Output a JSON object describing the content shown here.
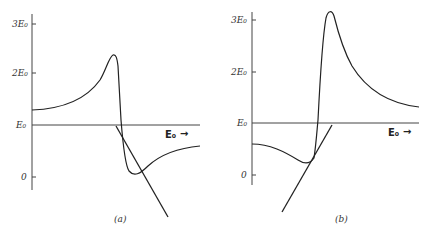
{
  "figure": {
    "panels": [
      {
        "id": "a",
        "caption": "(a)",
        "y_ticks": [
          "3E₀",
          "2E₀",
          "E₀",
          "0"
        ],
        "x_axis_label": "E₀",
        "x_axis_arrow": "→",
        "description": "Curve rises from ~1.3E0 to a peak near 2.4E0, drops sharply below E0 to a minimum near 0.1E0, then rises toward ~0.6E0; a straight tangent line crosses the falling branch."
      },
      {
        "id": "b",
        "caption": "(b)",
        "y_ticks": [
          "3E₀",
          "2E₀",
          "E₀",
          "0"
        ],
        "x_axis_label": "E₀",
        "x_axis_arrow": "→",
        "description": "Curve starts near 0.6E0, dips to a minimum near 0.25E0, rises sharply through E0 to a peak above 3E0, then decays toward ~1.3E0; a straight tangent line touches near the minimum."
      }
    ]
  }
}
